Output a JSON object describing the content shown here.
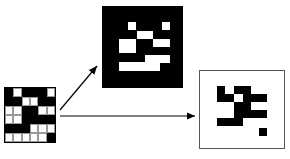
{
  "figure": {
    "input_grid": {
      "rows": 6,
      "cols": 6,
      "cells": [
        [
          "B",
          "W",
          "B",
          "B",
          "B",
          "W"
        ],
        [
          "B",
          "B",
          "W",
          "W",
          "B",
          "B"
        ],
        [
          "W",
          "W",
          "B",
          "B",
          "W",
          "W"
        ],
        [
          "W",
          "W",
          "B",
          "B",
          "B",
          "B"
        ],
        [
          "B",
          "B",
          "B",
          "W",
          "W",
          "W"
        ],
        [
          "W",
          "W",
          "W",
          "W",
          "W",
          "B"
        ]
      ]
    },
    "top_output": {
      "background": "#000000",
      "foreground": "#ffffff",
      "rects": [
        [
          128,
          22,
          8,
          8
        ],
        [
          162,
          22,
          8,
          8
        ],
        [
          137,
          31,
          16,
          8
        ],
        [
          119,
          39,
          17,
          14
        ],
        [
          153,
          39,
          17,
          8
        ],
        [
          145,
          55,
          25,
          8
        ],
        [
          119,
          62,
          41,
          9
        ]
      ]
    },
    "right_output": {
      "background": "#ffffff",
      "foreground": "#000000",
      "rects": [
        [
          217,
          86,
          8,
          16
        ],
        [
          224,
          94,
          10,
          8
        ],
        [
          234,
          86,
          17,
          8
        ],
        [
          243,
          94,
          24,
          8
        ],
        [
          234,
          102,
          17,
          8
        ],
        [
          234,
          110,
          33,
          8
        ],
        [
          217,
          118,
          26,
          8
        ],
        [
          259,
          128,
          8,
          8
        ]
      ]
    },
    "arrows": [
      {
        "from": [
          60,
          110
        ],
        "to": [
          97,
          66
        ]
      },
      {
        "from": [
          60,
          116
        ],
        "to": [
          195,
          116
        ]
      }
    ]
  }
}
